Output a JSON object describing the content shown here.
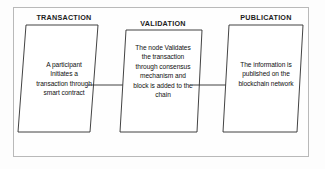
{
  "diagram": {
    "stages": [
      {
        "id": "transaction",
        "heading": "TRANSACTION",
        "body": "A participant\nInitiates a\ntransaction through\nsmart contract"
      },
      {
        "id": "validation",
        "heading": "VALIDATION",
        "body": "The node Validates\nthe transaction\nthrough consensus\nmechanism  and\nblock is added to the\nchain"
      },
      {
        "id": "publication",
        "heading": "PUBLICATION",
        "body": "The information is\npublished on the\nblockchain network"
      }
    ],
    "connectors": [
      {
        "id": "connector-1",
        "from": "transaction",
        "to": "validation",
        "style": "arrow-right"
      },
      {
        "id": "connector-2",
        "from": "validation",
        "to": "publication",
        "style": "arrow-right"
      }
    ],
    "colors": {
      "frame_border": "#b9b9b9",
      "shape_stroke": "#2e2e2e",
      "shape_fill": "#ffffff",
      "text": "#101010",
      "heading_text": "#1c1c1c",
      "background": "#fdfdfd"
    }
  }
}
